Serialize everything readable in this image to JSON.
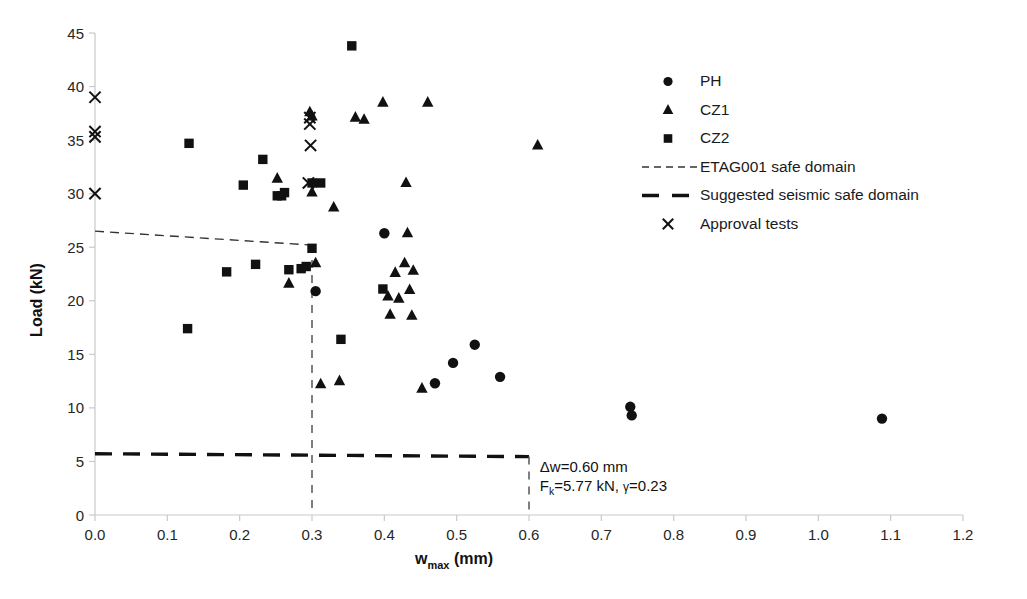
{
  "chart_data": {
    "type": "scatter",
    "title": "",
    "xlabel": "w_max (mm)",
    "xlabel_base": "w",
    "xlabel_subscript": "max",
    "xlabel_unit": "(mm)",
    "ylabel": "Load (kN)",
    "xlim": [
      0.0,
      1.2
    ],
    "ylim": [
      0,
      45
    ],
    "xticks": [
      "0.0",
      "0.1",
      "0.2",
      "0.3",
      "0.4",
      "0.5",
      "0.6",
      "0.7",
      "0.8",
      "0.9",
      "1.0",
      "1.1",
      "1.2"
    ],
    "xtick_values": [
      0.0,
      0.1,
      0.2,
      0.3,
      0.4,
      0.5,
      0.6,
      0.7,
      0.8,
      0.9,
      1.0,
      1.1,
      1.2
    ],
    "yticks": [
      "0",
      "5",
      "10",
      "15",
      "20",
      "25",
      "30",
      "35",
      "40",
      "45"
    ],
    "ytick_values": [
      0,
      5,
      10,
      15,
      20,
      25,
      30,
      35,
      40,
      45
    ],
    "grid": false,
    "legend_position": "upper-right",
    "marker_color": "#111111",
    "series": [
      {
        "name": "PH",
        "marker": "circle",
        "points": [
          [
            0.305,
            20.9
          ],
          [
            0.4,
            26.3
          ],
          [
            0.47,
            12.3
          ],
          [
            0.495,
            14.2
          ],
          [
            0.525,
            15.9
          ],
          [
            0.56,
            12.9
          ],
          [
            0.74,
            10.1
          ],
          [
            0.742,
            9.3
          ],
          [
            1.088,
            9.0
          ]
        ]
      },
      {
        "name": "CZ1",
        "marker": "triangle",
        "points": [
          [
            0.252,
            31.4
          ],
          [
            0.268,
            21.6
          ],
          [
            0.297,
            37.6
          ],
          [
            0.3,
            37.2
          ],
          [
            0.3,
            30.1
          ],
          [
            0.305,
            23.5
          ],
          [
            0.312,
            12.2
          ],
          [
            0.33,
            28.7
          ],
          [
            0.338,
            12.5
          ],
          [
            0.36,
            37.1
          ],
          [
            0.372,
            36.9
          ],
          [
            0.398,
            38.5
          ],
          [
            0.405,
            20.4
          ],
          [
            0.408,
            18.7
          ],
          [
            0.415,
            22.6
          ],
          [
            0.42,
            20.2
          ],
          [
            0.428,
            23.5
          ],
          [
            0.43,
            31.0
          ],
          [
            0.432,
            26.3
          ],
          [
            0.435,
            21.0
          ],
          [
            0.438,
            18.6
          ],
          [
            0.44,
            22.8
          ],
          [
            0.452,
            11.8
          ],
          [
            0.46,
            38.5
          ],
          [
            0.612,
            34.5
          ]
        ]
      },
      {
        "name": "CZ2",
        "marker": "square",
        "points": [
          [
            0.128,
            17.4
          ],
          [
            0.13,
            34.7
          ],
          [
            0.182,
            22.7
          ],
          [
            0.205,
            30.8
          ],
          [
            0.222,
            23.4
          ],
          [
            0.232,
            33.2
          ],
          [
            0.252,
            29.8
          ],
          [
            0.258,
            29.8
          ],
          [
            0.262,
            30.1
          ],
          [
            0.268,
            22.9
          ],
          [
            0.285,
            23.0
          ],
          [
            0.292,
            23.2
          ],
          [
            0.3,
            31.0
          ],
          [
            0.3,
            24.9
          ],
          [
            0.312,
            31.0
          ],
          [
            0.34,
            16.4
          ],
          [
            0.355,
            43.8
          ],
          [
            0.398,
            21.1
          ]
        ]
      },
      {
        "name": "Approval tests",
        "marker": "x",
        "points": [
          [
            0.0,
            39.0
          ],
          [
            0.0,
            35.8
          ],
          [
            0.0,
            35.3
          ],
          [
            0.0,
            30.0
          ],
          [
            0.297,
            37.1
          ],
          [
            0.297,
            36.5
          ],
          [
            0.298,
            34.5
          ],
          [
            0.295,
            31.0
          ]
        ]
      }
    ],
    "lines": [
      {
        "name": "ETAG001 safe domain",
        "style": "short-dash",
        "points": [
          [
            0.0,
            26.5
          ],
          [
            0.3,
            25.2
          ]
        ]
      },
      {
        "name": "Suggested seismic safe domain",
        "style": "long-dash",
        "points": [
          [
            0.0,
            5.72
          ],
          [
            0.6,
            5.45
          ]
        ]
      },
      {
        "name": "guide-vertical-0.3",
        "style": "dash",
        "points": [
          [
            0.3,
            25.2
          ],
          [
            0.3,
            0.0
          ]
        ]
      },
      {
        "name": "guide-vertical-0.6",
        "style": "dash",
        "points": [
          [
            0.6,
            5.45
          ],
          [
            0.6,
            0.0
          ]
        ]
      }
    ],
    "annotations": [
      {
        "id": "delta-w",
        "text": "Δw=0.60 mm",
        "x": 0.615,
        "y": 4.0
      },
      {
        "id": "fk-gamma",
        "text_prefix": "F",
        "text_sub": "k",
        "text_body": "=5.77 kN, ",
        "text_gamma": "γ",
        "text_suffix": "=0.23",
        "text": "Fk=5.77 kN, γ=0.23",
        "x": 0.615,
        "y": 2.2
      }
    ]
  },
  "legend": {
    "entries": [
      {
        "label": "PH",
        "marker": "circle"
      },
      {
        "label": "CZ1",
        "marker": "triangle"
      },
      {
        "label": "CZ2",
        "marker": "square"
      },
      {
        "label": "ETAG001 safe domain",
        "marker": "short-dash-line"
      },
      {
        "label": "Suggested seismic safe domain",
        "marker": "long-dash-line"
      },
      {
        "label": "Approval tests",
        "marker": "x"
      }
    ]
  },
  "axes": {
    "x_title_base": "w",
    "x_title_sub": "max",
    "x_title_unit": " (mm)",
    "y_title": "Load (kN)"
  }
}
